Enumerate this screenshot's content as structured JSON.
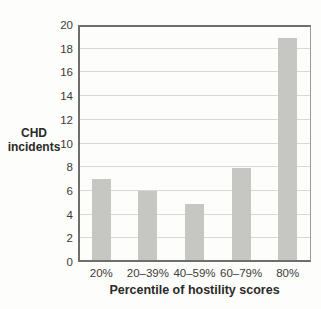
{
  "chart_data": {
    "type": "bar",
    "categories": [
      "20%",
      "20–39%",
      "40–59%",
      "60–79%",
      "80%"
    ],
    "values": [
      7,
      6,
      4.9,
      7.9,
      18.9
    ],
    "title": "",
    "xlabel": "Percentile of hostility scores",
    "ylabel": "CHD incidents",
    "ylim": [
      0,
      20
    ],
    "yticks": [
      0,
      2,
      4,
      6,
      8,
      10,
      12,
      14,
      16,
      18,
      20
    ],
    "grid": true,
    "legend": null,
    "bar_color": "#c6c6c3",
    "gridline_color": "#d8d8d5",
    "axis_color": "#6e6e6a",
    "frame_light_color": "#9b9b98",
    "text_color": "#333331",
    "background_color": "#fdfdfb"
  }
}
